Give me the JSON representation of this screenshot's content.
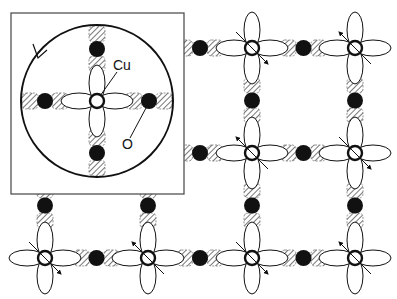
{
  "diagram": {
    "type": "CuO2 plane lattice with inset",
    "colors": {
      "line": "#111111",
      "oxygen_fill": "#111111",
      "hatch": "#555555",
      "background": "#ffffff"
    },
    "lattice": {
      "cu_columns_x": [
        45,
        148,
        252,
        355
      ],
      "cu_rows_y": [
        48,
        153,
        258
      ],
      "spacing": 103,
      "cu_sites": [
        {
          "x": 252,
          "y": 48,
          "spin": "se"
        },
        {
          "x": 355,
          "y": 48,
          "spin": "nw"
        },
        {
          "x": 252,
          "y": 153,
          "spin": "nw"
        },
        {
          "x": 355,
          "y": 153,
          "spin": "se"
        },
        {
          "x": 45,
          "y": 258,
          "spin": "se"
        },
        {
          "x": 148,
          "y": 258,
          "spin": "nw"
        },
        {
          "x": 252,
          "y": 258,
          "spin": "se"
        },
        {
          "x": 355,
          "y": 258,
          "spin": "nw"
        }
      ]
    },
    "inset": {
      "box": {
        "x": 11,
        "y": 13,
        "w": 173,
        "h": 181
      },
      "circle": {
        "cx": 97,
        "cy": 101,
        "r": 76,
        "direction": "counterclockwise"
      },
      "cu": {
        "x": 97,
        "y": 101
      },
      "labels": {
        "cu": "Cu",
        "o": "O"
      }
    }
  }
}
